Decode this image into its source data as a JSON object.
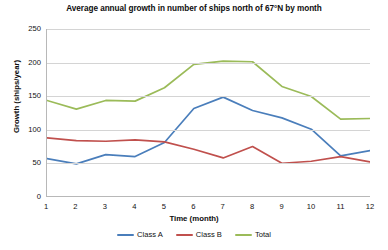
{
  "chart_data": {
    "type": "line",
    "title": "Average annual growth in number of ships north of 67°N by month",
    "xlabel": "Time (month)",
    "ylabel": "Growth (ships/year)",
    "x": [
      1,
      2,
      3,
      4,
      5,
      6,
      7,
      8,
      9,
      10,
      11,
      12
    ],
    "categories": [
      "1",
      "2",
      "3",
      "4",
      "5",
      "6",
      "7",
      "8",
      "9",
      "10",
      "11",
      "12"
    ],
    "xlim": [
      1,
      12
    ],
    "ylim": [
      0,
      250
    ],
    "yticks": [
      0,
      50,
      100,
      150,
      200,
      250
    ],
    "ytick_labels": [
      "0",
      "50",
      "100",
      "150",
      "200",
      "250"
    ],
    "grid": "horizontal",
    "legend_position": "bottom",
    "series": [
      {
        "name": "Class A",
        "color": "#4A7EBB",
        "values": [
          56,
          48,
          62,
          59,
          80,
          131,
          148,
          128,
          117,
          100,
          60,
          68
        ]
      },
      {
        "name": "Class B",
        "color": "#C0504D",
        "values": [
          87,
          83,
          82,
          84,
          81,
          70,
          57,
          74,
          49,
          52,
          59,
          51
        ]
      },
      {
        "name": "Total",
        "color": "#9BBB59",
        "values": [
          143,
          130,
          143,
          142,
          162,
          197,
          202,
          201,
          164,
          149,
          115,
          116
        ]
      }
    ]
  },
  "colors": {
    "class_a": "#4A7EBB",
    "class_b": "#C0504D",
    "total": "#9BBB59",
    "gridline": "#d4d4d4",
    "axis": "#b8b8b8",
    "background": "#ffffff",
    "text": "#111111"
  }
}
